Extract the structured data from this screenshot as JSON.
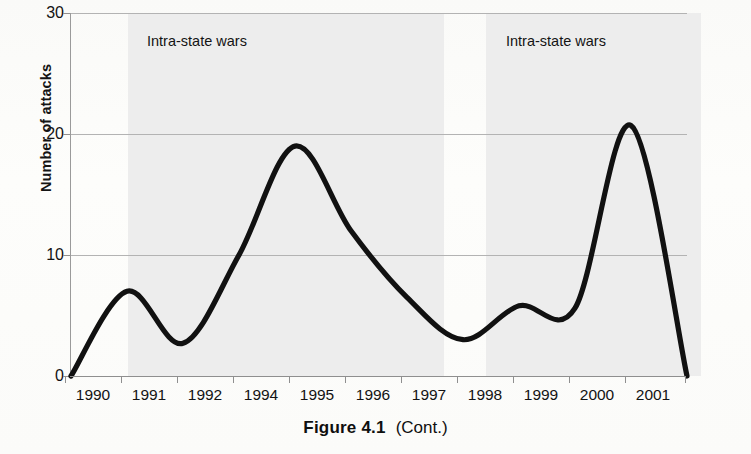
{
  "figure": {
    "caption_main": "Figure 4.1",
    "caption_sub": "(Cont.)"
  },
  "chart_data": {
    "type": "line",
    "title": "",
    "xlabel": "",
    "ylabel": "Number of attacks",
    "xlim": [
      1990,
      2001
    ],
    "ylim": [
      0,
      30
    ],
    "yticks": [
      0,
      10,
      20,
      30
    ],
    "ytick_labels": [
      "0",
      "10",
      "20",
      "30"
    ],
    "xtick_labels": [
      "1990",
      "1991",
      "1992",
      "1994",
      "1995",
      "1996",
      "1997",
      "1998",
      "1999",
      "2000",
      "2001"
    ],
    "grid": "horizontal",
    "legend": "none",
    "smoothing": "spline",
    "x": [
      1990,
      1991,
      1992,
      1993,
      1994,
      1995,
      1996,
      1997,
      1998,
      1999,
      2000,
      2001
    ],
    "values": [
      0,
      7,
      2.7,
      10,
      19,
      12,
      6.5,
      3,
      5.8,
      5.6,
      20.7,
      0
    ],
    "series": [
      {
        "name": "Number of attacks",
        "color": "#111111",
        "values": [
          0,
          7,
          2.7,
          10,
          19,
          12,
          6.5,
          3,
          5.8,
          5.6,
          20.7,
          0
        ]
      }
    ],
    "annotations": [
      {
        "text": "Intra-state wars",
        "x_start": 1990.9,
        "x_end": 1996.5
      },
      {
        "text": "Intra-state wars",
        "x_start": 1997.2,
        "x_end": 2000.6
      }
    ],
    "shaded_bands": [
      {
        "label": "Intra-state wars",
        "x_start": 1990.9,
        "x_end": 1996.5,
        "color": "#ececec"
      },
      {
        "label": "Intra-state wars",
        "x_start": 1997.2,
        "x_end": 2000.6,
        "color": "#ececec"
      }
    ]
  },
  "yticks": [
    {
      "label": "30",
      "top": 5
    },
    {
      "label": "20",
      "top": 126
    },
    {
      "label": "10",
      "top": 247
    },
    {
      "label": "0",
      "top": 368
    }
  ],
  "xticks": [
    {
      "label": "1990",
      "left": 93
    },
    {
      "label": "1991",
      "left": 149
    },
    {
      "label": "1992",
      "left": 205
    },
    {
      "label": "1994",
      "left": 261
    },
    {
      "label": "1995",
      "left": 317
    },
    {
      "label": "1996",
      "left": 373
    },
    {
      "label": "1997",
      "left": 429
    },
    {
      "label": "1998",
      "left": 485
    },
    {
      "label": "1999",
      "left": 541
    },
    {
      "label": "2000",
      "left": 597
    },
    {
      "label": "2001",
      "left": 653
    }
  ],
  "bands": [
    {
      "label": "Intra-state wars",
      "left": 57,
      "width": 316,
      "label_left": 76
    },
    {
      "label": "Intra-state wars",
      "left": 415,
      "width": 215,
      "label_left": 435
    }
  ]
}
